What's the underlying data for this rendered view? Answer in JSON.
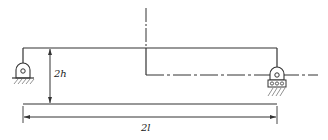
{
  "diagram": {
    "type": "beam-structure",
    "labels": {
      "height": "2h",
      "length": "2l"
    },
    "supports": [
      {
        "name": "left",
        "kind": "pinned"
      },
      {
        "name": "right",
        "kind": "roller"
      }
    ],
    "colors": {
      "line": "#333333",
      "background": "#ffffff"
    }
  }
}
